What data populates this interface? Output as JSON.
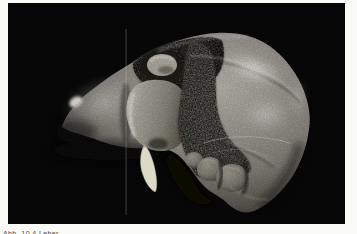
{
  "page": {
    "background": "#fafaf7"
  },
  "figure": {
    "label": "3D volume rendering of a liver on black background",
    "viewport_bg": "#060606",
    "palette": {
      "organ_light": "#bdbab2",
      "organ_mid": "#8a867e",
      "organ_dark": "#3a372f",
      "organ_edge": "#262420",
      "specular": "#ffffff",
      "fissure_dark": "#39342a",
      "rough_patch": "#6e6960",
      "strand": "#dcdac6",
      "artifact_line": "#d8d6d0"
    },
    "caption": {
      "text": "Abb. 10.4  Leber",
      "color": "#4a4a48",
      "clipped_by_bottom_edge": true
    }
  }
}
